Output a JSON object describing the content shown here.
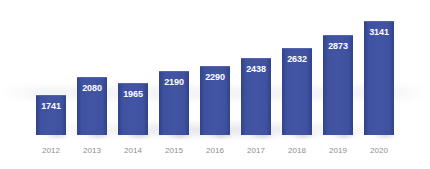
{
  "chart_data": {
    "type": "bar",
    "title": "",
    "subtitle": "",
    "xlabel": "",
    "ylabel": "",
    "categories": [
      "2012",
      "2013",
      "2014",
      "2015",
      "2016",
      "2017",
      "2018",
      "2019",
      "2020"
    ],
    "values": [
      1741,
      2080,
      1965,
      2190,
      2290,
      2438,
      2632,
      2873,
      3141
    ],
    "data_labels": [
      "1741",
      "2080",
      "1965",
      "2190",
      "2290",
      "2438",
      "2632",
      "2873",
      "3141"
    ],
    "ylim": [
      1000,
      3300
    ],
    "grid": false,
    "legend": null,
    "legend_position": "none",
    "annotations": [],
    "axis_lines": false,
    "tick_labels_x": [
      "2012",
      "2013",
      "2014",
      "2015",
      "2016",
      "2017",
      "2018",
      "2019",
      "2020"
    ],
    "tick_labels_y": [],
    "series": [
      {
        "name": "",
        "values": [
          1741,
          2080,
          1965,
          2190,
          2290,
          2438,
          2632,
          2873,
          3141
        ]
      }
    ]
  },
  "style": {
    "bar_color": "#3E52A0",
    "bar_edge_color": "#32428A",
    "bar_highlight_color": "#4354A3",
    "value_label_color": "#FFFFFF",
    "category_label_color": "#8E8E93",
    "background_color": "#FFFFFF",
    "shadow_color": "#787D8C"
  },
  "layout": {
    "bar_width_px": 30,
    "bar_pitch_px": 41,
    "first_bar_left_px": 36,
    "baseline_y_px": 135,
    "max_bar_top_y_px": 12,
    "min_bar_top_y_px": 67
  }
}
